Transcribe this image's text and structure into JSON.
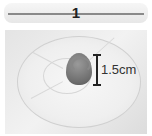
{
  "step": {
    "number": "1"
  },
  "photo": {
    "description": "plate with piped dough swirl",
    "measurement": {
      "label": "1.5cm"
    }
  }
}
